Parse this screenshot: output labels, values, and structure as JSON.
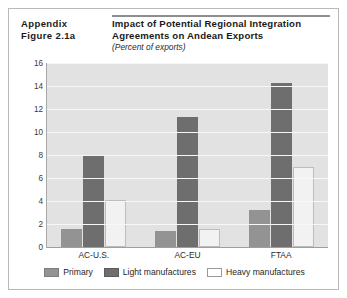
{
  "header": {
    "appendix_line1": "Appendix",
    "appendix_line2": "Figure 2.1a"
  },
  "chart_data": {
    "type": "bar",
    "title": "Impact of Potential Regional Integration Agreements on Andean Exports",
    "subtitle": "(Percent of exports)",
    "xlabel": "",
    "ylabel": "",
    "ylim": [
      0,
      16
    ],
    "yticks": [
      0,
      2,
      4,
      6,
      8,
      10,
      12,
      14,
      16
    ],
    "grid": true,
    "legend_position": "bottom",
    "categories": [
      "AC-U.S.",
      "AC-EU",
      "FTAA"
    ],
    "series": [
      {
        "name": "Primary",
        "key": "primary",
        "color": "#939393",
        "values": [
          1.6,
          1.4,
          3.2
        ]
      },
      {
        "name": "Light manufactures",
        "key": "light",
        "color": "#6e6e6e",
        "values": [
          8.0,
          11.3,
          14.3
        ]
      },
      {
        "name": "Heavy manufactures",
        "key": "heavy",
        "color": "#f2f2f2",
        "values": [
          4.1,
          1.6,
          7.0
        ]
      }
    ]
  }
}
